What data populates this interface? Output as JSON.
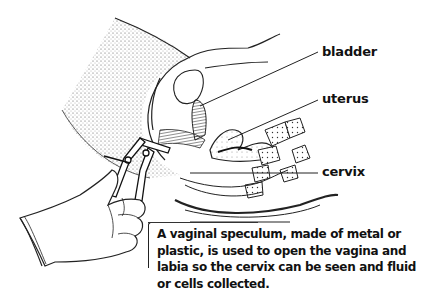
{
  "diagram": {
    "labels": [
      {
        "id": "bladder",
        "text": "bladder"
      },
      {
        "id": "uterus",
        "text": "uterus"
      },
      {
        "id": "cervix",
        "text": "cervix"
      }
    ],
    "caption": "A vaginal speculum, made of metal or plastic, is used to open the vagina and labia so the cervix can be seen and fluid or cells collected.",
    "colors": {
      "ink": "#111111",
      "background": "#ffffff",
      "stipple": "#888888"
    }
  }
}
